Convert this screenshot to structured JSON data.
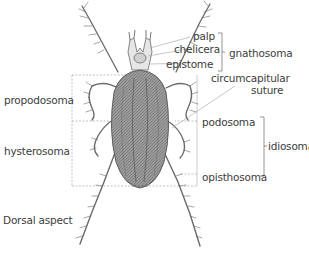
{
  "diagram": {
    "view_label": "Dorsal aspect",
    "labels": {
      "palp": "palp",
      "chelicera": "chelicera",
      "epistome": "epistome",
      "gnathosoma": "gnathosoma",
      "circumcapitular_line1": "circumcapitular",
      "circumcapitular_line2": "suture",
      "podosoma": "podosoma",
      "idiosoma": "idiosoma",
      "opisthosoma": "opisthosoma",
      "propodosoma": "propodosoma",
      "hysterosoma": "hysterosoma"
    },
    "colors": {
      "body_fill": "#8a8a8a",
      "body_dark": "#5a5a5a",
      "leg_stroke": "#6a6a6a",
      "guide_line": "#9a9a9a",
      "text": "#3c3c3c"
    }
  }
}
